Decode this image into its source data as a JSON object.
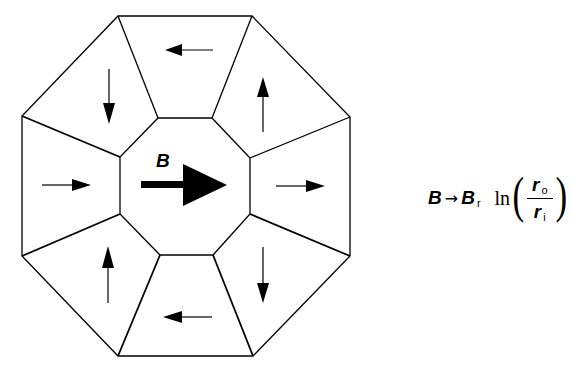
{
  "diagram": {
    "center_label": "B",
    "center_arrow_direction": "right",
    "segments": [
      {
        "position": "top",
        "arrow": "left"
      },
      {
        "position": "top-right",
        "arrow": "up"
      },
      {
        "position": "right",
        "arrow": "right"
      },
      {
        "position": "bottom-right",
        "arrow": "down"
      },
      {
        "position": "bottom",
        "arrow": "left"
      },
      {
        "position": "bottom-left",
        "arrow": "up"
      },
      {
        "position": "left",
        "arrow": "right"
      },
      {
        "position": "top-left",
        "arrow": "down"
      }
    ],
    "colors": {
      "stroke": "#000000",
      "fill": "#ffffff"
    }
  },
  "formula": {
    "lhs": "B",
    "arrow": "→",
    "rhs_symbol": "B",
    "rhs_subscript": "r",
    "function": "ln",
    "paren_open": "(",
    "paren_close": ")",
    "numerator_symbol": "r",
    "numerator_subscript": "o",
    "denominator_symbol": "r",
    "denominator_subscript": "i"
  }
}
